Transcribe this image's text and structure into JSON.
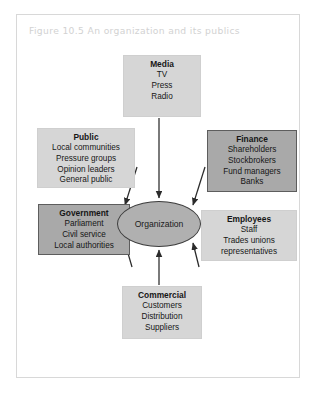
{
  "figure": {
    "caption": "Figure 10.5  An organization and its publics"
  },
  "diagram": {
    "type": "hub-and-spoke",
    "center": {
      "label": "Organization",
      "shape": "ellipse",
      "fill": "#b0b0b0",
      "border": "#3d3d3d"
    },
    "arrow_direction": "inward-to-center",
    "nodes": [
      {
        "id": "media",
        "title": "Media",
        "items": [
          "TV",
          "Press",
          "Radio"
        ],
        "shade": "light",
        "fill": "#d6d6d6",
        "position": "top"
      },
      {
        "id": "public",
        "title": "Public",
        "items": [
          "Local communities",
          "Pressure groups",
          "Opinion leaders",
          "General public"
        ],
        "shade": "light",
        "fill": "#d6d6d6",
        "position": "upper-left"
      },
      {
        "id": "finance",
        "title": "Finance",
        "items": [
          "Shareholders",
          "Stockbrokers",
          "Fund managers",
          "Banks"
        ],
        "shade": "dark",
        "fill": "#a9a9a9",
        "position": "upper-right"
      },
      {
        "id": "government",
        "title": "Government",
        "items": [
          "Parliament",
          "Civil service",
          "Local authorities"
        ],
        "shade": "dark",
        "fill": "#a9a9a9",
        "position": "lower-left"
      },
      {
        "id": "employees",
        "title": "Employees",
        "items": [
          "Staff",
          "Trades unions",
          "representatives"
        ],
        "shade": "light",
        "fill": "#d6d6d6",
        "position": "lower-right"
      },
      {
        "id": "commercial",
        "title": "Commercial",
        "items": [
          "Customers",
          "Distribution",
          "Suppliers"
        ],
        "shade": "light",
        "fill": "#d6d6d6",
        "position": "bottom"
      }
    ],
    "colors": {
      "frame_border": "#d8d8d8",
      "caption_text": "#d2d2d2",
      "arrow": "#2b2b2b",
      "page_background": "#ffffff"
    }
  }
}
